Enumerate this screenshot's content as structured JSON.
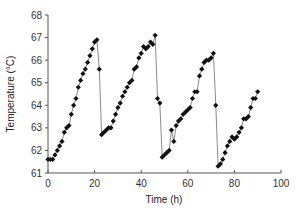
{
  "chart_data": {
    "type": "line",
    "title": "",
    "xlabel": "Time (h)",
    "ylabel": "Temperature (°C)",
    "xlim": [
      0,
      100
    ],
    "ylim": [
      61,
      68
    ],
    "xticks": [
      0,
      20,
      40,
      60,
      80,
      100
    ],
    "yticks": [
      61,
      62,
      63,
      64,
      65,
      66,
      67,
      68
    ],
    "grid": false,
    "legend": null,
    "marker": "diamond",
    "series": [
      {
        "name": "Temperature",
        "color": "#111111",
        "line_color": "#8a8a8a",
        "x": [
          0,
          1,
          2,
          3,
          4,
          5,
          6,
          7,
          8,
          9,
          10,
          11,
          12,
          13,
          14,
          15,
          16,
          17,
          18,
          19,
          20,
          21,
          22,
          23,
          24,
          25,
          26,
          27,
          28,
          29,
          30,
          31,
          32,
          33,
          34,
          35,
          36,
          37,
          38,
          39,
          40,
          41,
          42,
          43,
          44,
          45,
          46,
          47,
          48,
          49,
          50,
          51,
          52,
          53,
          54,
          55,
          56,
          57,
          58,
          59,
          60,
          61,
          62,
          63,
          64,
          65,
          66,
          67,
          68,
          69,
          70,
          71,
          72,
          73,
          74,
          75,
          76,
          77,
          78,
          79,
          80,
          81,
          82,
          83,
          84,
          85,
          86,
          87,
          88,
          89,
          90
        ],
        "y": [
          61.6,
          61.6,
          61.6,
          61.8,
          62.0,
          62.2,
          62.4,
          62.8,
          63.0,
          63.1,
          63.6,
          64.0,
          64.3,
          64.8,
          65.1,
          65.4,
          65.6,
          65.9,
          66.2,
          66.5,
          66.8,
          66.9,
          65.6,
          62.7,
          62.8,
          62.9,
          63.0,
          63.0,
          63.3,
          63.6,
          63.9,
          64.1,
          64.4,
          64.6,
          64.8,
          65.0,
          65.1,
          65.6,
          65.7,
          66.1,
          66.3,
          66.6,
          66.5,
          66.6,
          66.8,
          66.7,
          67.1,
          64.3,
          64.1,
          61.7,
          61.8,
          61.9,
          62.0,
          62.9,
          62.4,
          63.1,
          63.3,
          63.4,
          63.6,
          63.7,
          63.8,
          63.9,
          64.3,
          64.6,
          64.6,
          65.3,
          65.6,
          65.9,
          66.0,
          66.0,
          66.1,
          66.3,
          64.0,
          61.3,
          61.4,
          61.6,
          61.9,
          62.2,
          62.4,
          62.6,
          62.5,
          62.6,
          62.8,
          63.0,
          63.4,
          63.4,
          63.5,
          63.9,
          64.3,
          64.3,
          64.6
        ]
      }
    ]
  },
  "axes": {
    "x_title": "Time (h)",
    "y_title": "Temperature (°C)",
    "x_tick_labels": [
      "0",
      "20",
      "40",
      "60",
      "80",
      "100"
    ],
    "y_tick_labels": [
      "61",
      "62",
      "63",
      "64",
      "65",
      "66",
      "67",
      "68"
    ]
  }
}
